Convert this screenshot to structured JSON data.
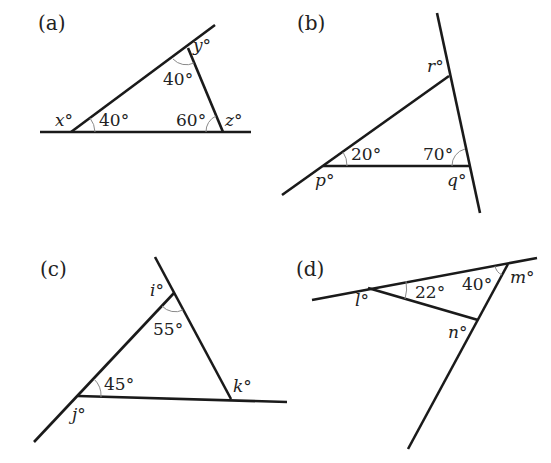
{
  "diagrams": {
    "a": {
      "panel_label": "(a)",
      "unknowns": {
        "x": "x°",
        "y": "y°",
        "z": "z°"
      },
      "angles": {
        "at_x": "40°",
        "at_y": "40°",
        "at_z": "60°"
      }
    },
    "b": {
      "panel_label": "(b)",
      "unknowns": {
        "p": "p°",
        "q": "q°",
        "r": "r°"
      },
      "angles": {
        "at_p": "20°",
        "at_q": "70°"
      }
    },
    "c": {
      "panel_label": "(c)",
      "unknowns": {
        "i": "i°",
        "j": "j°",
        "k": "k°"
      },
      "angles": {
        "at_i": "55°",
        "at_j": "45°"
      }
    },
    "d": {
      "panel_label": "(d)",
      "unknowns": {
        "l": "l°",
        "m": "m°",
        "n": "n°"
      },
      "angles": {
        "at_l": "22°",
        "at_m": "40°"
      }
    }
  },
  "colors": {
    "line": "#1a1a1a",
    "arc": "#8a8a8a",
    "text": "#222222",
    "background": "#ffffff"
  }
}
